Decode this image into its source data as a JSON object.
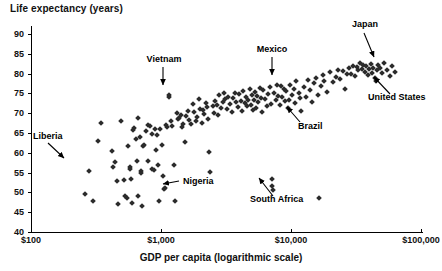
{
  "chart_data": {
    "type": "scatter",
    "title": "Life expectancy (years)",
    "xlabel": "GDP per capita (logarithmic scale)",
    "ylabel": "Life expectancy (years)",
    "x_scale": "log",
    "xlim": [
      100,
      100000
    ],
    "ylim": [
      40,
      92
    ],
    "grid": false,
    "legend": "none",
    "x_ticks": [
      "$100",
      "$1,000",
      "$10,000",
      "$100,000"
    ],
    "x_tick_values": [
      100,
      1000,
      10000,
      100000
    ],
    "y_ticks": [
      "40",
      "45",
      "50",
      "55",
      "60",
      "65",
      "70",
      "75",
      "80",
      "85",
      "90"
    ],
    "y_tick_values": [
      40,
      45,
      50,
      55,
      60,
      65,
      70,
      75,
      80,
      85,
      90
    ],
    "annotations": [
      {
        "label": "Liberia",
        "x": 280,
        "y": 55.4
      },
      {
        "label": "Vietnam",
        "x": 1150,
        "y": 74.5
      },
      {
        "label": "Nigeria",
        "x": 1060,
        "y": 50.8
      },
      {
        "label": "Mexico",
        "x": 8800,
        "y": 76.0
      },
      {
        "label": "Brazil",
        "x": 9700,
        "y": 73.2
      },
      {
        "label": "South Africa",
        "x": 7200,
        "y": 51.6
      },
      {
        "label": "Japan",
        "x": 34000,
        "y": 82.7
      },
      {
        "label": "United States",
        "x": 45000,
        "y": 78.2
      }
    ],
    "points": [
      {
        "x": 260,
        "y": 49.5
      },
      {
        "x": 300,
        "y": 47.8
      },
      {
        "x": 280,
        "y": 55.4
      },
      {
        "x": 330,
        "y": 62.9
      },
      {
        "x": 345,
        "y": 67.5
      },
      {
        "x": 420,
        "y": 60.4
      },
      {
        "x": 430,
        "y": 56.3
      },
      {
        "x": 440,
        "y": 57.6
      },
      {
        "x": 460,
        "y": 52.8
      },
      {
        "x": 470,
        "y": 47.0
      },
      {
        "x": 495,
        "y": 68.1
      },
      {
        "x": 520,
        "y": 53.2
      },
      {
        "x": 530,
        "y": 49.2
      },
      {
        "x": 545,
        "y": 48.6
      },
      {
        "x": 560,
        "y": 61.7
      },
      {
        "x": 575,
        "y": 56.3
      },
      {
        "x": 580,
        "y": 55.8
      },
      {
        "x": 590,
        "y": 53.5
      },
      {
        "x": 600,
        "y": 47.4
      },
      {
        "x": 610,
        "y": 65.8
      },
      {
        "x": 625,
        "y": 66.3
      },
      {
        "x": 640,
        "y": 63.4
      },
      {
        "x": 650,
        "y": 58.0
      },
      {
        "x": 660,
        "y": 49.0
      },
      {
        "x": 670,
        "y": 68.8
      },
      {
        "x": 690,
        "y": 64.0
      },
      {
        "x": 700,
        "y": 55.3
      },
      {
        "x": 705,
        "y": 55.0
      },
      {
        "x": 715,
        "y": 46.6
      },
      {
        "x": 730,
        "y": 61.6
      },
      {
        "x": 740,
        "y": 62.0
      },
      {
        "x": 760,
        "y": 65.5
      },
      {
        "x": 790,
        "y": 58.0
      },
      {
        "x": 800,
        "y": 67.0
      },
      {
        "x": 820,
        "y": 66.7
      },
      {
        "x": 850,
        "y": 64.8
      },
      {
        "x": 860,
        "y": 55.9
      },
      {
        "x": 880,
        "y": 55.6
      },
      {
        "x": 900,
        "y": 66.0
      },
      {
        "x": 910,
        "y": 60.7
      },
      {
        "x": 930,
        "y": 64.5
      },
      {
        "x": 950,
        "y": 56.9
      },
      {
        "x": 970,
        "y": 47.8
      },
      {
        "x": 990,
        "y": 65.9
      },
      {
        "x": 1010,
        "y": 62.0
      },
      {
        "x": 1030,
        "y": 54.2
      },
      {
        "x": 1060,
        "y": 50.8
      },
      {
        "x": 1070,
        "y": 51.0
      },
      {
        "x": 1100,
        "y": 67.1
      },
      {
        "x": 1120,
        "y": 66.5
      },
      {
        "x": 1150,
        "y": 74.5
      },
      {
        "x": 1160,
        "y": 74.0
      },
      {
        "x": 1190,
        "y": 68.0
      },
      {
        "x": 1210,
        "y": 66.8
      },
      {
        "x": 1250,
        "y": 56.8
      },
      {
        "x": 1280,
        "y": 47.9
      },
      {
        "x": 1320,
        "y": 70.0
      },
      {
        "x": 1350,
        "y": 68.5
      },
      {
        "x": 1380,
        "y": 68.9
      },
      {
        "x": 1420,
        "y": 69.5
      },
      {
        "x": 1450,
        "y": 66.5
      },
      {
        "x": 1480,
        "y": 67.2
      },
      {
        "x": 1520,
        "y": 62.8
      },
      {
        "x": 1560,
        "y": 69.3
      },
      {
        "x": 1600,
        "y": 70.5
      },
      {
        "x": 1650,
        "y": 68.3
      },
      {
        "x": 1700,
        "y": 67.3
      },
      {
        "x": 1750,
        "y": 72.2
      },
      {
        "x": 1800,
        "y": 70.2
      },
      {
        "x": 1850,
        "y": 68.0
      },
      {
        "x": 1900,
        "y": 69.0
      },
      {
        "x": 1950,
        "y": 73.6
      },
      {
        "x": 2000,
        "y": 71.0
      },
      {
        "x": 2050,
        "y": 67.6
      },
      {
        "x": 2100,
        "y": 70.8
      },
      {
        "x": 2150,
        "y": 69.8
      },
      {
        "x": 2200,
        "y": 72.5
      },
      {
        "x": 2250,
        "y": 71.5
      },
      {
        "x": 2300,
        "y": 68.4
      },
      {
        "x": 2350,
        "y": 60.3
      },
      {
        "x": 2400,
        "y": 55.2
      },
      {
        "x": 2500,
        "y": 71.8
      },
      {
        "x": 2550,
        "y": 70.1
      },
      {
        "x": 2600,
        "y": 73.0
      },
      {
        "x": 2700,
        "y": 72.0
      },
      {
        "x": 2750,
        "y": 69.6
      },
      {
        "x": 2800,
        "y": 74.5
      },
      {
        "x": 2900,
        "y": 71.2
      },
      {
        "x": 3000,
        "y": 72.8
      },
      {
        "x": 3050,
        "y": 75.0
      },
      {
        "x": 3100,
        "y": 73.5
      },
      {
        "x": 3200,
        "y": 71.0
      },
      {
        "x": 3300,
        "y": 74.2
      },
      {
        "x": 3400,
        "y": 72.4
      },
      {
        "x": 3500,
        "y": 70.4
      },
      {
        "x": 3600,
        "y": 73.8
      },
      {
        "x": 3700,
        "y": 75.2
      },
      {
        "x": 3800,
        "y": 72.9
      },
      {
        "x": 3900,
        "y": 71.6
      },
      {
        "x": 4000,
        "y": 74.8
      },
      {
        "x": 4100,
        "y": 73.1
      },
      {
        "x": 4200,
        "y": 70.6
      },
      {
        "x": 4300,
        "y": 75.6
      },
      {
        "x": 4400,
        "y": 72.6
      },
      {
        "x": 4500,
        "y": 74.0
      },
      {
        "x": 4600,
        "y": 71.9
      },
      {
        "x": 4700,
        "y": 73.4
      },
      {
        "x": 4800,
        "y": 76.0
      },
      {
        "x": 4900,
        "y": 72.1
      },
      {
        "x": 5000,
        "y": 74.6
      },
      {
        "x": 5100,
        "y": 70.9
      },
      {
        "x": 5200,
        "y": 73.2
      },
      {
        "x": 5300,
        "y": 75.4
      },
      {
        "x": 5400,
        "y": 71.4
      },
      {
        "x": 5500,
        "y": 74.3
      },
      {
        "x": 5600,
        "y": 72.7
      },
      {
        "x": 5800,
        "y": 76.3
      },
      {
        "x": 5900,
        "y": 73.9
      },
      {
        "x": 6000,
        "y": 70.2
      },
      {
        "x": 6100,
        "y": 75.8
      },
      {
        "x": 6300,
        "y": 73.6
      },
      {
        "x": 6500,
        "y": 71.7
      },
      {
        "x": 6700,
        "y": 74.9
      },
      {
        "x": 6900,
        "y": 76.5
      },
      {
        "x": 7000,
        "y": 72.3
      },
      {
        "x": 7100,
        "y": 53.4
      },
      {
        "x": 7200,
        "y": 51.6
      },
      {
        "x": 7250,
        "y": 50.5
      },
      {
        "x": 7400,
        "y": 75.0
      },
      {
        "x": 7600,
        "y": 73.3
      },
      {
        "x": 7800,
        "y": 77.2
      },
      {
        "x": 8000,
        "y": 74.4
      },
      {
        "x": 8200,
        "y": 72.0
      },
      {
        "x": 8400,
        "y": 76.8
      },
      {
        "x": 8600,
        "y": 74.1
      },
      {
        "x": 8800,
        "y": 76.0
      },
      {
        "x": 9000,
        "y": 73.0
      },
      {
        "x": 9200,
        "y": 75.5
      },
      {
        "x": 9400,
        "y": 71.3
      },
      {
        "x": 9700,
        "y": 73.2
      },
      {
        "x": 9900,
        "y": 77.0
      },
      {
        "x": 10200,
        "y": 74.7
      },
      {
        "x": 10500,
        "y": 76.2
      },
      {
        "x": 10800,
        "y": 72.6
      },
      {
        "x": 11000,
        "y": 78.0
      },
      {
        "x": 11500,
        "y": 75.1
      },
      {
        "x": 11800,
        "y": 73.7
      },
      {
        "x": 12000,
        "y": 70.5
      },
      {
        "x": 12500,
        "y": 76.6
      },
      {
        "x": 13000,
        "y": 74.0
      },
      {
        "x": 13500,
        "y": 78.4
      },
      {
        "x": 14000,
        "y": 75.9
      },
      {
        "x": 14500,
        "y": 72.8
      },
      {
        "x": 15000,
        "y": 77.5
      },
      {
        "x": 15500,
        "y": 79.0
      },
      {
        "x": 16000,
        "y": 74.6
      },
      {
        "x": 16500,
        "y": 48.5
      },
      {
        "x": 17000,
        "y": 76.9
      },
      {
        "x": 17500,
        "y": 79.6
      },
      {
        "x": 18000,
        "y": 78.2
      },
      {
        "x": 19000,
        "y": 75.4
      },
      {
        "x": 20000,
        "y": 80.3
      },
      {
        "x": 21000,
        "y": 77.8
      },
      {
        "x": 22000,
        "y": 79.2
      },
      {
        "x": 23000,
        "y": 81.0
      },
      {
        "x": 24000,
        "y": 78.6
      },
      {
        "x": 25000,
        "y": 80.6
      },
      {
        "x": 26000,
        "y": 76.2
      },
      {
        "x": 27000,
        "y": 79.9
      },
      {
        "x": 28000,
        "y": 81.4
      },
      {
        "x": 29000,
        "y": 80.0
      },
      {
        "x": 30000,
        "y": 82.0
      },
      {
        "x": 31000,
        "y": 79.4
      },
      {
        "x": 32000,
        "y": 81.6
      },
      {
        "x": 33000,
        "y": 80.8
      },
      {
        "x": 34000,
        "y": 82.7
      },
      {
        "x": 35000,
        "y": 81.2
      },
      {
        "x": 36000,
        "y": 82.2
      },
      {
        "x": 37000,
        "y": 80.4
      },
      {
        "x": 38000,
        "y": 81.8
      },
      {
        "x": 39000,
        "y": 79.7
      },
      {
        "x": 40000,
        "y": 81.1
      },
      {
        "x": 41000,
        "y": 82.4
      },
      {
        "x": 42000,
        "y": 80.2
      },
      {
        "x": 43000,
        "y": 81.5
      },
      {
        "x": 44000,
        "y": 79.0
      },
      {
        "x": 45000,
        "y": 78.2
      },
      {
        "x": 46000,
        "y": 80.9
      },
      {
        "x": 47000,
        "y": 82.1
      },
      {
        "x": 48000,
        "y": 81.3
      },
      {
        "x": 50000,
        "y": 80.1
      },
      {
        "x": 52000,
        "y": 82.6
      },
      {
        "x": 55000,
        "y": 81.0
      },
      {
        "x": 58000,
        "y": 79.5
      },
      {
        "x": 60000,
        "y": 81.9
      },
      {
        "x": 63000,
        "y": 80.5
      }
    ]
  }
}
